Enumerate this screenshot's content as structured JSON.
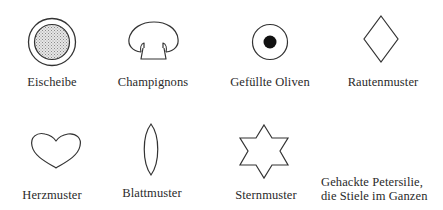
{
  "items": [
    {
      "label": "Eischeibe",
      "icon": "egg-slice-icon"
    },
    {
      "label": "Champignons",
      "icon": "mushroom-icon"
    },
    {
      "label": "Gefüllte Oliven",
      "icon": "stuffed-olive-icon"
    },
    {
      "label": "Rautenmuster",
      "icon": "diamond-icon"
    },
    {
      "label": "Herzmuster",
      "icon": "heart-icon"
    },
    {
      "label": "Blattmuster",
      "icon": "leaf-icon"
    },
    {
      "label": "Sternmuster",
      "icon": "star-icon"
    },
    {
      "label_line1": "Gehackte Petersilie,",
      "label_line2": "die Stiele im Ganzen",
      "icon": "none"
    }
  ],
  "colors": {
    "stroke": "#333333",
    "fill_dark": "#111111",
    "fill_stipple": "#c8c8c8"
  }
}
